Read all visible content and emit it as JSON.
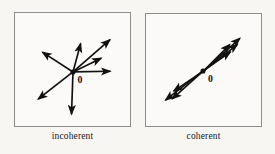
{
  "figure": {
    "background_color": "#f8f6f3",
    "panel_fill": "#fbfaf8",
    "panel_border_color": "#8d8d8d",
    "ink_color": "#111111",
    "panels": [
      {
        "id": "incoherent",
        "caption": "incoherent",
        "origin_label": "0",
        "origin": {
          "x": 59,
          "y": 60
        },
        "description": "vectors pointing in scattered random directions",
        "vectors": [
          {
            "name": "vector-up-right-long",
            "angle_deg": 41,
            "length": 50
          },
          {
            "name": "vector-up-right-short",
            "angle_deg": 26,
            "length": 32
          },
          {
            "name": "vector-up-steep",
            "angle_deg": 75,
            "length": 30
          },
          {
            "name": "vector-up-left",
            "angle_deg": 147,
            "length": 37
          },
          {
            "name": "vector-down-left",
            "angle_deg": 218,
            "length": 45
          },
          {
            "name": "vector-down",
            "angle_deg": 268,
            "length": 43
          },
          {
            "name": "vector-right",
            "angle_deg": 1,
            "length": 38
          }
        ]
      },
      {
        "id": "coherent",
        "caption": "coherent",
        "origin_label": "0",
        "origin": {
          "x": 58,
          "y": 58
        },
        "description": "vectors all aligned along a common diagonal axis",
        "vectors": [
          {
            "name": "vector-up-right-1",
            "angle_deg": 42,
            "length": 52
          },
          {
            "name": "vector-up-right-2",
            "angle_deg": 38,
            "length": 45
          },
          {
            "name": "vector-up-right-3",
            "angle_deg": 45,
            "length": 38
          },
          {
            "name": "vector-up-right-4",
            "angle_deg": 35,
            "length": 33
          },
          {
            "name": "vector-down-left-1",
            "angle_deg": 218,
            "length": 50
          },
          {
            "name": "vector-down-left-2",
            "angle_deg": 222,
            "length": 43
          },
          {
            "name": "vector-down-left-3",
            "angle_deg": 214,
            "length": 36
          }
        ]
      }
    ]
  }
}
